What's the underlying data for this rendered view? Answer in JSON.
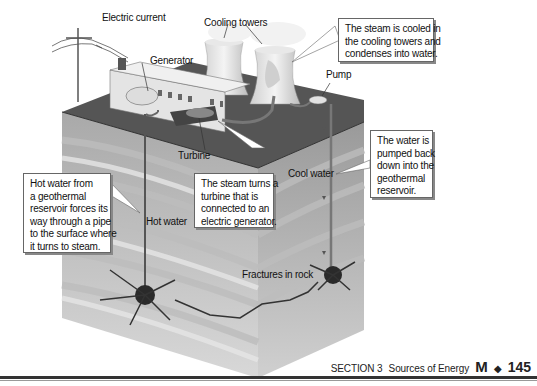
{
  "diagram": {
    "labels": {
      "electric_current": "Electric current",
      "generator": "Generator",
      "cooling_towers": "Cooling towers",
      "pump": "Pump",
      "turbine": "Turbine",
      "hot_water": "Hot water",
      "cool_water": "Cool water",
      "fractures": "Fractures in rock"
    },
    "callouts": {
      "steam_cooled": [
        "The steam is cooled in",
        "the cooling towers and",
        "condenses into water."
      ],
      "water_pumped": [
        "The water is",
        "pumped back",
        "down into the",
        "geothermal",
        "reservoir."
      ],
      "hot_water_from": [
        "Hot water from",
        "a geothermal",
        "reservoir forces its",
        "way through a pipe",
        "to the surface where",
        "it turns to steam."
      ],
      "steam_turns": [
        "The steam turns a",
        "turbine that is",
        "connected to an",
        "electric generator."
      ]
    }
  },
  "footer": {
    "section": "SECTION 3",
    "section_title": "Sources of Energy",
    "unit_letter": "M",
    "separator": "◆",
    "page_number": "145"
  }
}
